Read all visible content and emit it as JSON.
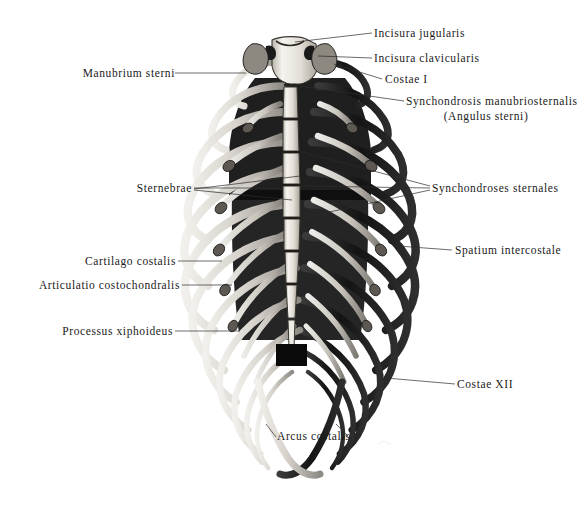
{
  "plate": {
    "title": "Anterior view of the human thorax (sternum and rib cage)",
    "background_color": "#ffffff",
    "ink_color": "#111111",
    "leader_color": "#2b2b2b",
    "width": 580,
    "height": 506
  },
  "labels": {
    "incisura_jugularis": "Incisura jugularis",
    "incisura_clavicularis": "Incisura clavicularis",
    "costae_i": "Costae I",
    "synchondrosis_manubriosternalis": "Synchondrosis manubriosternalis",
    "angulus_sterni": "(Angulus sterni)",
    "manubrium_sterni": "Manubrium sterni",
    "sternebrae": "Sternebrae",
    "synchondroses_sternales": "Synchondroses sternales",
    "cartilago_costalis": "Cartilago costalis",
    "spatium_intercostale": "Spatium intercostale",
    "articulatio_costochondralis": "Articulatio costochondralis",
    "processus_xiphoideus": "Processus xiphoideus",
    "costae_xii": "Costae XII",
    "arcus_costalis": "Arcus costalis"
  },
  "anatomy": {
    "sternum": {
      "manubrium": "manubrium-sterni",
      "body_segments": 6,
      "xiphoid": "processus-xiphoideus"
    },
    "ribs": {
      "pairs": 12,
      "first_rib": "Costae I",
      "last_rib": "Costae XII",
      "costal_arch": "Arcus costalis"
    }
  }
}
